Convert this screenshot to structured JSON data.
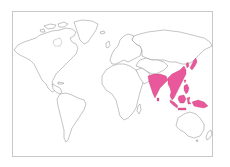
{
  "map": {
    "title": "World map with highlighted distribution range",
    "projection": "world outline, Pacific-excluded (Americas left, Asia right)",
    "colors": {
      "background": "#ffffff",
      "land_fill": "#ffffff",
      "coastline": "#7a7a7a",
      "frame": "#c8c8c8",
      "highlight": "#e8589a"
    },
    "highlighted_regions": [
      "Indian subcontinent",
      "Southern & eastern China",
      "Japan",
      "Taiwan",
      "Mainland Southeast Asia",
      "Philippines",
      "Malay Peninsula",
      "Sumatra",
      "Borneo",
      "Java",
      "Sulawesi",
      "New Guinea"
    ],
    "legend": null
  }
}
